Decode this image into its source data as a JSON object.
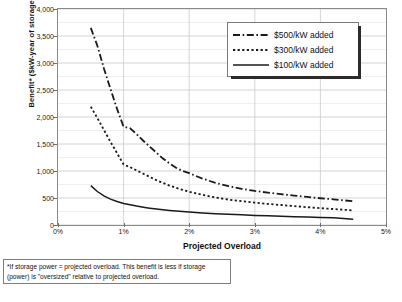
{
  "chart_data": {
    "type": "line",
    "title": "",
    "xlabel": "Projected Overload",
    "ylabel": "Benefit* ($kW-year of storage)",
    "xlim": [
      0,
      5
    ],
    "ylim": [
      0,
      4000
    ],
    "xticklabels": [
      "0%",
      "1%",
      "2%",
      "3%",
      "4%",
      "5%"
    ],
    "xtickvalues": [
      0,
      1,
      2,
      3,
      4,
      5
    ],
    "yticklabels": [
      "0",
      "500",
      "1,000",
      "1,500",
      "2,000",
      "2,500",
      "3,000",
      "3,500",
      "4,000"
    ],
    "ytickvalues": [
      0,
      500,
      1000,
      1500,
      2000,
      2500,
      3000,
      3500,
      4000
    ],
    "grid": true,
    "minor_grid_interval": 250,
    "legend_position": "top-right",
    "x": [
      0.5,
      0.6,
      0.7,
      0.8,
      0.9,
      1.0,
      1.1,
      1.2,
      1.3,
      1.4,
      1.5,
      1.6,
      1.7,
      1.8,
      1.9,
      2.0,
      2.2,
      2.4,
      2.6,
      2.8,
      3.0,
      3.2,
      3.4,
      3.6,
      3.8,
      4.0,
      4.2,
      4.5
    ],
    "series": [
      {
        "name": "$500/kW added",
        "style": "dash-dot",
        "color": "#1a1a1a",
        "values": [
          3650,
          3320,
          2900,
          2520,
          2150,
          1820,
          1790,
          1680,
          1560,
          1450,
          1340,
          1230,
          1140,
          1060,
          1000,
          960,
          860,
          780,
          720,
          670,
          630,
          600,
          570,
          545,
          520,
          495,
          475,
          440
        ]
      },
      {
        "name": "$300/kW added",
        "style": "dotted",
        "color": "#1a1a1a",
        "values": [
          2190,
          1980,
          1760,
          1540,
          1330,
          1120,
          1070,
          1010,
          950,
          890,
          830,
          780,
          730,
          690,
          650,
          615,
          560,
          510,
          470,
          440,
          415,
          390,
          370,
          350,
          330,
          312,
          296,
          270
        ]
      },
      {
        "name": "$100/kW added",
        "style": "solid",
        "color": "#1a1a1a",
        "values": [
          730,
          620,
          540,
          480,
          435,
          400,
          375,
          350,
          330,
          312,
          296,
          282,
          270,
          258,
          248,
          240,
          224,
          210,
          198,
          188,
          178,
          170,
          162,
          155,
          148,
          140,
          132,
          105
        ]
      }
    ],
    "footnote": "*If storage power = projected overload. This benefit is less if storage (power) is \"oversized\" relative to projected overload."
  },
  "legend": {
    "items": [
      {
        "label": "$500/kW added",
        "style": "dash-dot"
      },
      {
        "label": "$300/kW added",
        "style": "dotted"
      },
      {
        "label": "$100/kW added",
        "style": "solid"
      }
    ]
  },
  "axes": {
    "x_title": "Projected Overload",
    "y_title": "Benefit* ($kW-year of storage)"
  },
  "footnote": {
    "text": "*If storage power = projected overload. This benefit is less if storage (power) is \"oversized\" relative to projected overload."
  },
  "colors": {
    "line": "#1a1a1a",
    "grid_major": "#c9c9c9",
    "grid_minor": "#e4e4e4",
    "frame": "#8a8a8a"
  }
}
